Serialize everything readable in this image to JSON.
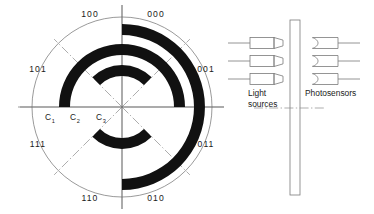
{
  "figure": {
    "name": "optical-shaft-encoder-diagram",
    "encoder_disk": {
      "name": "binary-coded-encoder-disk",
      "center": [
        122,
        107
      ],
      "outer_radius": 90,
      "sector_count": 8,
      "sector_labels": [
        {
          "code": "000",
          "angle_deg": 22.5,
          "label_x": 156,
          "label_y": 17,
          "anchor": "middle"
        },
        {
          "code": "001",
          "angle_deg": 67.5,
          "label_x": 206,
          "label_y": 72,
          "anchor": "middle"
        },
        {
          "code": "011",
          "angle_deg": 112.5,
          "label_x": 206,
          "label_y": 147,
          "anchor": "middle"
        },
        {
          "code": "010",
          "angle_deg": 157.5,
          "label_x": 156,
          "label_y": 201,
          "anchor": "middle"
        },
        {
          "code": "110",
          "angle_deg": 202.5,
          "label_x": 90,
          "label_y": 201,
          "anchor": "middle"
        },
        {
          "code": "111",
          "angle_deg": 247.5,
          "label_x": 38,
          "label_y": 147,
          "anchor": "middle"
        },
        {
          "code": "101",
          "angle_deg": 292.5,
          "label_x": 38,
          "label_y": 72,
          "anchor": "middle"
        },
        {
          "code": "100",
          "angle_deg": 337.5,
          "label_x": 90,
          "label_y": 17,
          "anchor": "middle"
        }
      ],
      "tracks": [
        {
          "name": "C1",
          "base": "C",
          "subscript": "1",
          "label_x": 48,
          "label_y": 120,
          "inner_radius": 72,
          "outer_radius": 83,
          "black_arcs": [
            {
              "start_deg": 0,
              "end_deg": 180
            }
          ]
        },
        {
          "name": "C2",
          "base": "C",
          "subscript": "2",
          "label_x": 73,
          "label_y": 120,
          "inner_radius": 52,
          "outer_radius": 63,
          "black_arcs": [
            {
              "start_deg": -90,
              "end_deg": 90
            }
          ]
        },
        {
          "name": "C3",
          "base": "C",
          "subscript": "3",
          "label_x": 99,
          "label_y": 120,
          "inner_radius": 31,
          "outer_radius": 42,
          "black_arcs": [
            {
              "start_deg": -45,
              "end_deg": 45
            },
            {
              "start_deg": 135,
              "end_deg": 225
            }
          ]
        }
      ]
    },
    "reader_assembly": {
      "name": "optical-reader-assembly",
      "disk_edge": {
        "name": "encoder-disk-edge-view",
        "x": 290,
        "y": 20,
        "width": 10,
        "height": 175
      },
      "light_sources": {
        "label": "Light sources",
        "label_lines": [
          "Light",
          "sources"
        ],
        "count": 3,
        "lamp_y": [
          43,
          61,
          79
        ]
      },
      "photosensors": {
        "label": "Photosensors",
        "label_lines": [
          "Photosensors"
        ],
        "count": 3,
        "sensor_y": [
          43,
          61,
          79
        ]
      },
      "center_line": {
        "name": "optical-axis-centerline",
        "y": 108
      }
    }
  },
  "colors": {
    "segment_black": "#111111",
    "line_gray": "#6e6e6e",
    "outline_gray": "#7a7a7a",
    "text": "#1a1a1a",
    "background": "#ffffff"
  }
}
